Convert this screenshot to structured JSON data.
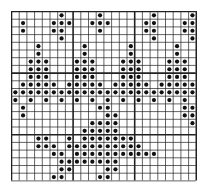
{
  "chart_data": {
    "type": "heatmap",
    "title": "",
    "cols": 24,
    "rows": 22,
    "cell": 7.7,
    "bold_every": 8,
    "colors": {
      "grid": "#222222",
      "dot": "#111111",
      "background": "#ffffff"
    },
    "dots": [
      [
        1,
        1
      ],
      [
        1,
        2
      ],
      [
        5,
        1
      ],
      [
        6,
        0
      ],
      [
        6,
        1
      ],
      [
        6,
        2
      ],
      [
        7,
        1
      ],
      [
        5,
        2
      ],
      [
        6,
        3
      ],
      [
        10,
        1
      ],
      [
        11,
        0
      ],
      [
        11,
        1
      ],
      [
        11,
        2
      ],
      [
        12,
        1
      ],
      [
        17,
        1
      ],
      [
        17,
        2
      ],
      [
        18,
        0
      ],
      [
        18,
        1
      ],
      [
        18,
        2
      ],
      [
        18,
        3
      ],
      [
        22,
        1
      ],
      [
        22,
        2
      ],
      [
        23,
        0
      ],
      [
        23,
        1
      ],
      [
        23,
        2
      ],
      [
        23,
        3
      ],
      [
        3,
        4
      ],
      [
        3,
        5
      ],
      [
        2,
        6
      ],
      [
        3,
        6
      ],
      [
        4,
        6
      ],
      [
        2,
        7
      ],
      [
        3,
        7
      ],
      [
        4,
        7
      ],
      [
        2,
        8
      ],
      [
        3,
        8
      ],
      [
        4,
        8
      ],
      [
        1,
        9
      ],
      [
        2,
        9
      ],
      [
        3,
        9
      ],
      [
        4,
        9
      ],
      [
        5,
        9
      ],
      [
        9,
        4
      ],
      [
        9,
        5
      ],
      [
        8,
        6
      ],
      [
        9,
        6
      ],
      [
        10,
        6
      ],
      [
        8,
        7
      ],
      [
        9,
        7
      ],
      [
        10,
        7
      ],
      [
        8,
        8
      ],
      [
        9,
        8
      ],
      [
        10,
        8
      ],
      [
        7,
        9
      ],
      [
        8,
        9
      ],
      [
        9,
        9
      ],
      [
        10,
        9
      ],
      [
        11,
        9
      ],
      [
        15,
        4
      ],
      [
        15,
        5
      ],
      [
        14,
        6
      ],
      [
        15,
        6
      ],
      [
        16,
        6
      ],
      [
        14,
        7
      ],
      [
        15,
        7
      ],
      [
        16,
        7
      ],
      [
        14,
        8
      ],
      [
        15,
        8
      ],
      [
        16,
        8
      ],
      [
        13,
        9
      ],
      [
        14,
        9
      ],
      [
        15,
        9
      ],
      [
        16,
        9
      ],
      [
        17,
        9
      ],
      [
        21,
        4
      ],
      [
        21,
        5
      ],
      [
        20,
        6
      ],
      [
        21,
        6
      ],
      [
        22,
        6
      ],
      [
        20,
        7
      ],
      [
        21,
        7
      ],
      [
        22,
        7
      ],
      [
        20,
        8
      ],
      [
        21,
        8
      ],
      [
        22,
        8
      ],
      [
        19,
        9
      ],
      [
        20,
        9
      ],
      [
        21,
        9
      ],
      [
        22,
        9
      ],
      [
        23,
        9
      ],
      [
        0,
        10
      ],
      [
        1,
        10
      ],
      [
        2,
        10
      ],
      [
        3,
        10
      ],
      [
        4,
        10
      ],
      [
        5,
        10
      ],
      [
        6,
        10
      ],
      [
        7,
        10
      ],
      [
        8,
        10
      ],
      [
        9,
        10
      ],
      [
        10,
        10
      ],
      [
        11,
        10
      ],
      [
        12,
        10
      ],
      [
        13,
        10
      ],
      [
        14,
        10
      ],
      [
        15,
        10
      ],
      [
        16,
        10
      ],
      [
        17,
        10
      ],
      [
        18,
        10
      ],
      [
        19,
        10
      ],
      [
        20,
        10
      ],
      [
        21,
        10
      ],
      [
        22,
        10
      ],
      [
        23,
        10
      ],
      [
        0,
        11
      ],
      [
        2,
        11
      ],
      [
        4,
        11
      ],
      [
        6,
        11
      ],
      [
        8,
        11
      ],
      [
        10,
        11
      ],
      [
        12,
        11
      ],
      [
        14,
        11
      ],
      [
        16,
        11
      ],
      [
        18,
        11
      ],
      [
        20,
        11
      ],
      [
        22,
        11
      ],
      [
        1,
        12
      ],
      [
        1,
        13
      ],
      [
        11,
        12
      ],
      [
        12,
        12
      ],
      [
        12,
        13
      ],
      [
        12,
        14
      ],
      [
        13,
        13
      ],
      [
        13,
        14
      ],
      [
        10,
        14
      ],
      [
        11,
        14
      ],
      [
        10,
        15
      ],
      [
        11,
        15
      ],
      [
        12,
        15
      ],
      [
        13,
        15
      ],
      [
        22,
        12
      ],
      [
        22,
        13
      ],
      [
        23,
        12
      ],
      [
        23,
        13
      ],
      [
        23,
        14
      ],
      [
        7,
        16
      ],
      [
        9,
        15
      ],
      [
        9,
        16
      ],
      [
        10,
        16
      ],
      [
        11,
        16
      ],
      [
        12,
        16
      ],
      [
        13,
        16
      ],
      [
        14,
        16
      ],
      [
        15,
        16
      ],
      [
        3,
        16
      ],
      [
        4,
        16
      ],
      [
        3,
        17
      ],
      [
        4,
        17
      ],
      [
        5,
        17
      ],
      [
        5,
        18
      ],
      [
        6,
        18
      ],
      [
        7,
        17
      ],
      [
        8,
        17
      ],
      [
        9,
        17
      ],
      [
        10,
        17
      ],
      [
        11,
        17
      ],
      [
        12,
        17
      ],
      [
        13,
        17
      ],
      [
        14,
        17
      ],
      [
        15,
        17
      ],
      [
        16,
        17
      ],
      [
        6,
        19
      ],
      [
        7,
        19
      ],
      [
        8,
        18
      ],
      [
        9,
        18
      ],
      [
        10,
        18
      ],
      [
        11,
        18
      ],
      [
        12,
        18
      ],
      [
        13,
        18
      ],
      [
        14,
        18
      ],
      [
        15,
        18
      ],
      [
        16,
        18
      ],
      [
        17,
        18
      ],
      [
        18,
        18
      ],
      [
        6,
        20
      ],
      [
        7,
        20
      ],
      [
        8,
        19
      ],
      [
        9,
        19
      ],
      [
        10,
        19
      ],
      [
        11,
        19
      ],
      [
        12,
        19
      ],
      [
        13,
        19
      ],
      [
        5,
        21
      ],
      [
        6,
        21
      ],
      [
        12,
        20
      ],
      [
        13,
        20
      ],
      [
        11,
        21
      ],
      [
        12,
        21
      ]
    ]
  }
}
